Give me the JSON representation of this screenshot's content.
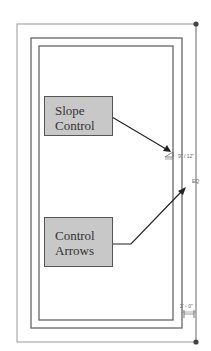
{
  "diagram": {
    "callouts": [
      {
        "id": "slope-control",
        "line1": "Slope",
        "line2": "Control"
      },
      {
        "id": "control-arrows",
        "line1": "Control",
        "line2": "Arrows"
      }
    ],
    "annotations": {
      "slope_value": "9\" / 12\"",
      "eq_label": "EQ",
      "overhang_dim": "2' - 0\""
    },
    "colors": {
      "line": "#888888",
      "dark_line": "#666666",
      "box_fill": "#c8c8c8",
      "box_border": "#555555",
      "arrow": "#222222",
      "dot": "#444444"
    }
  }
}
